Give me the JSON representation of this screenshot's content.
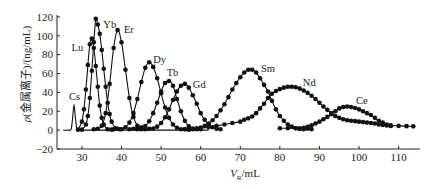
{
  "chart_data": {
    "type": "line",
    "title": "",
    "xlabel": "V_R/mL",
    "xlabel_parts": {
      "symbol": "V",
      "subscript": "R",
      "rest": "/mL"
    },
    "ylabel": "ρ(金属离子)/(ng/mL)",
    "ylabel_parts": {
      "symbol": "ρ",
      "rest": "(金属离子)/(ng/mL)"
    },
    "xlim": [
      23.7,
      115.4
    ],
    "ylim": [
      -20,
      122
    ],
    "xticks": [
      30,
      40,
      50,
      60,
      70,
      80,
      90,
      100,
      110
    ],
    "yticks": [
      -20,
      0,
      20,
      40,
      60,
      80,
      100,
      120
    ],
    "grid": false,
    "legend": "none (inline peak labels)",
    "series": [
      {
        "name": "Cs",
        "markers": false,
        "label_pos": [
          26.7,
          31.9
        ],
        "points": [
          [
            25.3,
            0
          ],
          [
            26.5,
            0
          ],
          [
            27.3,
            1.5
          ],
          [
            27.65,
            13
          ],
          [
            28.0,
            27
          ],
          [
            28.35,
            13
          ],
          [
            28.7,
            1.5
          ],
          [
            29.5,
            0
          ],
          [
            31,
            0
          ],
          [
            45,
            0
          ],
          [
            62,
            0
          ]
        ]
      },
      {
        "name": "Lu",
        "markers": true,
        "label_pos": [
          27.4,
          84.2
        ],
        "points": [
          [
            29.0,
            0.5
          ],
          [
            30.0,
            9
          ],
          [
            30.5,
            22
          ],
          [
            31.0,
            43
          ],
          [
            31.5,
            69
          ],
          [
            32.0,
            91
          ],
          [
            32.5,
            97
          ],
          [
            33.0,
            87
          ],
          [
            33.5,
            68
          ],
          [
            34.0,
            46
          ],
          [
            34.5,
            26
          ],
          [
            35.0,
            13
          ],
          [
            35.5,
            6
          ],
          [
            36.5,
            1
          ],
          [
            37.5,
            0.5
          ]
        ]
      },
      {
        "name": "Yb",
        "markers": true,
        "label_pos": [
          35.4,
          108.6
        ],
        "points": [
          [
            30.0,
            0.5
          ],
          [
            31.0,
            6
          ],
          [
            31.5,
            15
          ],
          [
            32.0,
            34
          ],
          [
            32.5,
            63
          ],
          [
            33.0,
            93
          ],
          [
            33.5,
            118
          ],
          [
            34.0,
            112
          ],
          [
            34.5,
            102
          ],
          [
            35.0,
            85
          ],
          [
            35.5,
            65
          ],
          [
            36.0,
            46
          ],
          [
            36.5,
            29
          ],
          [
            37.0,
            17
          ],
          [
            37.5,
            9
          ],
          [
            38.5,
            2
          ],
          [
            39.5,
            1
          ]
        ]
      },
      {
        "name": "Er",
        "markers": true,
        "label_pos": [
          40.6,
          102.7
        ],
        "points": [
          [
            33,
            1
          ],
          [
            34,
            1.5
          ],
          [
            35,
            4.7
          ],
          [
            36,
            18
          ],
          [
            37,
            49
          ],
          [
            38,
            87
          ],
          [
            39,
            106
          ],
          [
            40,
            93
          ],
          [
            41,
            64
          ],
          [
            42,
            34
          ],
          [
            43,
            14
          ],
          [
            44,
            4.7
          ],
          [
            45,
            1
          ]
        ]
      },
      {
        "name": "Dy",
        "markers": true,
        "label_pos": [
          48.0,
          71.5
        ],
        "points": [
          [
            38,
            1
          ],
          [
            39,
            1.5
          ],
          [
            40,
            1
          ],
          [
            41,
            3
          ],
          [
            42,
            8
          ],
          [
            43,
            18
          ],
          [
            44,
            33
          ],
          [
            45,
            51
          ],
          [
            46,
            66
          ],
          [
            47,
            72
          ],
          [
            48,
            67
          ],
          [
            49,
            55
          ],
          [
            50,
            39
          ],
          [
            51,
            24
          ],
          [
            52,
            13
          ],
          [
            53,
            6
          ],
          [
            54,
            2.5
          ],
          [
            55,
            1
          ],
          [
            56,
            1
          ],
          [
            57,
            0.5
          ]
        ]
      },
      {
        "name": "Tb",
        "markers": true,
        "label_pos": [
          51.4,
          57.2
        ],
        "points": [
          [
            42,
            1
          ],
          [
            43,
            1.5
          ],
          [
            44,
            2
          ],
          [
            45,
            3
          ],
          [
            46,
            4.3
          ],
          [
            47,
            9.4
          ],
          [
            48,
            18
          ],
          [
            49,
            29
          ],
          [
            50,
            41
          ],
          [
            51,
            50
          ],
          [
            52,
            52
          ],
          [
            53,
            47
          ],
          [
            54,
            33
          ],
          [
            55,
            20
          ],
          [
            56,
            10
          ],
          [
            57,
            4
          ],
          [
            58,
            1.5
          ],
          [
            59,
            1
          ],
          [
            60,
            1
          ]
        ]
      },
      {
        "name": "Gd",
        "markers": true,
        "label_pos": [
          58.0,
          44.2
        ],
        "points": [
          [
            44,
            1
          ],
          [
            45,
            1.5
          ],
          [
            46,
            1
          ],
          [
            47,
            1.5
          ],
          [
            48,
            1.7
          ],
          [
            49,
            3.7
          ],
          [
            50,
            7.6
          ],
          [
            51,
            13.6
          ],
          [
            52,
            22
          ],
          [
            53,
            32
          ],
          [
            54,
            41
          ],
          [
            55,
            47
          ],
          [
            56,
            49
          ],
          [
            57,
            45
          ],
          [
            58,
            37
          ],
          [
            59,
            28
          ],
          [
            60,
            18
          ],
          [
            61,
            11
          ],
          [
            62,
            6
          ],
          [
            63,
            3
          ],
          [
            64,
            1.5
          ],
          [
            65,
            1
          ]
        ]
      },
      {
        "name": "Sm",
        "markers": true,
        "label_pos": [
          75.2,
          61.8
        ],
        "points": [
          [
            58,
            1
          ],
          [
            59,
            2
          ],
          [
            60,
            2.8
          ],
          [
            61,
            4.5
          ],
          [
            62,
            7
          ],
          [
            63,
            10.5
          ],
          [
            64,
            15
          ],
          [
            65,
            21
          ],
          [
            66,
            27.5
          ],
          [
            67,
            35
          ],
          [
            68,
            43
          ],
          [
            69,
            50
          ],
          [
            70,
            56
          ],
          [
            71,
            61
          ],
          [
            72,
            64
          ],
          [
            73,
            64
          ],
          [
            74,
            61
          ],
          [
            75,
            55
          ],
          [
            76,
            48
          ],
          [
            77,
            41
          ],
          [
            78,
            31
          ],
          [
            79,
            22
          ],
          [
            80,
            15
          ],
          [
            81,
            10
          ],
          [
            82,
            6
          ],
          [
            83,
            3.7
          ],
          [
            84,
            2
          ],
          [
            85,
            1.2
          ],
          [
            86,
            1
          ],
          [
            87,
            1.5
          ],
          [
            88,
            1
          ]
        ]
      },
      {
        "name": "Nd",
        "markers": true,
        "label_pos": [
          85.8,
          46.7
        ],
        "points": [
          [
            56,
            1
          ],
          [
            58,
            1.5
          ],
          [
            60,
            2
          ],
          [
            62,
            3
          ],
          [
            64,
            4.5
          ],
          [
            66,
            6
          ],
          [
            68,
            7.5
          ],
          [
            70,
            9
          ],
          [
            71,
            11
          ],
          [
            72,
            12.5
          ],
          [
            73,
            14.5
          ],
          [
            74,
            18
          ],
          [
            75,
            23
          ],
          [
            76,
            28
          ],
          [
            77,
            34
          ],
          [
            78,
            38.5
          ],
          [
            79,
            41.5
          ],
          [
            80,
            43.5
          ],
          [
            81,
            45
          ],
          [
            82,
            46
          ],
          [
            83,
            46
          ],
          [
            84,
            45.5
          ],
          [
            85,
            44
          ],
          [
            86,
            42
          ],
          [
            87,
            39.5
          ],
          [
            88,
            36.5
          ],
          [
            89,
            33
          ],
          [
            90,
            29
          ],
          [
            91,
            25
          ],
          [
            92,
            21.5
          ],
          [
            93,
            18
          ],
          [
            94,
            15
          ],
          [
            95,
            13
          ],
          [
            96,
            11.5
          ],
          [
            97,
            10.5
          ],
          [
            98,
            10
          ],
          [
            99,
            9.5
          ],
          [
            100,
            9
          ],
          [
            101,
            8.5
          ],
          [
            102,
            8
          ],
          [
            103,
            7.5
          ],
          [
            104,
            7
          ],
          [
            105,
            6
          ],
          [
            106,
            5.5
          ],
          [
            107,
            5
          ],
          [
            108,
            4.5
          ]
        ]
      },
      {
        "name": "Ce",
        "markers": true,
        "label_pos": [
          99.2,
          27.6
        ],
        "points": [
          [
            80,
            2
          ],
          [
            82,
            2
          ],
          [
            84,
            2
          ],
          [
            85,
            2
          ],
          [
            86,
            2.5
          ],
          [
            87,
            3.5
          ],
          [
            88,
            5
          ],
          [
            89,
            7
          ],
          [
            90,
            9
          ],
          [
            91,
            11.5
          ],
          [
            92,
            14
          ],
          [
            93,
            17
          ],
          [
            94,
            20
          ],
          [
            95,
            23
          ],
          [
            96,
            24.5
          ],
          [
            97,
            25
          ],
          [
            98,
            24.5
          ],
          [
            99,
            23.5
          ],
          [
            100,
            22
          ],
          [
            101,
            20
          ],
          [
            102,
            18
          ],
          [
            103,
            16
          ],
          [
            104,
            13
          ],
          [
            105,
            10
          ],
          [
            106,
            8
          ],
          [
            107,
            6
          ],
          [
            108,
            5
          ],
          [
            110,
            4.5
          ],
          [
            112,
            4.2
          ],
          [
            113.7,
            4
          ]
        ]
      }
    ]
  }
}
